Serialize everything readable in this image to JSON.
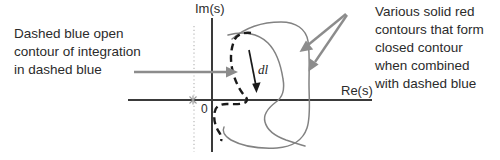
{
  "figure": {
    "width": 500,
    "height": 160,
    "background": "#ffffff"
  },
  "annotations": {
    "left_caption": "Dashed blue open\ncontour of integration\nin dashed blue",
    "left_caption_lines": [
      "Dashed blue open",
      "contour of integration",
      "in dashed blue"
    ],
    "right_caption": "Various solid red\ncontours that form\nclosed contour\nwhen combined\nwith dashed blue",
    "right_caption_lines": [
      "Various solid red",
      "contours that form",
      "closed contour",
      "when combined",
      "with dashed blue"
    ]
  },
  "axes": {
    "imaginary_label": "Im(s)",
    "real_label": "Re(s)",
    "origin_label": "0",
    "axis_color": "#3a3a3a",
    "dotted_line_color": "#b8b8b8"
  },
  "contours": {
    "dashed_label": "dl",
    "dashed_color": "#1a1a1a",
    "solid_color": "#808080",
    "arrow_color": "#8c8c8c",
    "dl_arrow_color": "#1a1a1a"
  },
  "colors": {
    "text": "#2b2b2b",
    "dashed_contour": "#1a1a1a",
    "solid_contour": "#808080",
    "leader_arrow": "#8c8c8c",
    "axis": "#3a3a3a",
    "pole_marker": "#a0a0a0"
  },
  "markers": {
    "pole_symbol": "asterisk-pole-marker"
  }
}
